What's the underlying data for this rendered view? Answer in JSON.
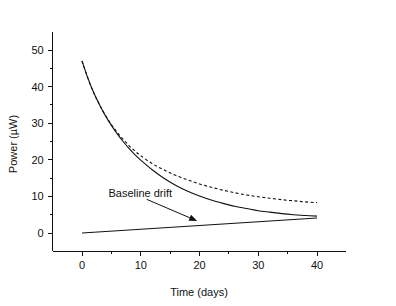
{
  "chart_data": {
    "type": "line",
    "title": "",
    "xlabel": "Time (days)",
    "ylabel": "Power (µW)",
    "xlim": [
      -5,
      45
    ],
    "ylim": [
      -5,
      55
    ],
    "xticks": [
      0,
      10,
      20,
      30,
      40
    ],
    "xtick_labels": [
      "0",
      "10",
      "20",
      "30",
      "40"
    ],
    "yticks": [
      0,
      10,
      20,
      30,
      40,
      50
    ],
    "ytick_labels": [
      "0",
      "10",
      "20",
      "30",
      "40",
      "50"
    ],
    "x_minor_ticks": [
      5,
      15,
      25,
      35
    ],
    "y_minor_ticks": [
      5,
      15,
      25,
      35,
      45
    ],
    "grid": false,
    "legend": "none",
    "series": [
      {
        "name": "Measured power (solid)",
        "style": "solid",
        "color": "#111111",
        "x": [
          0,
          1,
          2,
          3,
          4,
          5,
          6,
          7,
          8,
          9,
          10,
          12,
          14,
          16,
          18,
          20,
          22,
          24,
          26,
          28,
          30,
          32,
          34,
          36,
          38,
          40
        ],
        "y": [
          47.0,
          42.3,
          38.3,
          35.0,
          32.0,
          29.4,
          27.1,
          25.0,
          23.1,
          21.4,
          19.9,
          17.2,
          14.9,
          13.0,
          11.4,
          10.1,
          9.0,
          8.1,
          7.3,
          6.7,
          6.1,
          5.7,
          5.3,
          5.0,
          4.8,
          4.6
        ]
      },
      {
        "name": "Fitted decay (dashed)",
        "style": "dashed",
        "color": "#111111",
        "x": [
          0,
          1,
          2,
          3,
          4,
          5,
          6,
          7,
          8,
          9,
          10,
          12,
          14,
          16,
          18,
          20,
          22,
          24,
          26,
          28,
          30,
          32,
          34,
          36,
          38,
          40
        ],
        "y": [
          47.0,
          42.3,
          38.3,
          35.0,
          32.1,
          29.6,
          27.5,
          25.6,
          23.9,
          22.4,
          21.1,
          18.9,
          17.2,
          15.7,
          14.5,
          13.4,
          12.5,
          11.7,
          11.0,
          10.4,
          9.9,
          9.5,
          9.1,
          8.8,
          8.5,
          8.3
        ]
      },
      {
        "name": "Baseline drift",
        "style": "solid",
        "color": "#111111",
        "x": [
          0,
          40
        ],
        "y": [
          0.0,
          4.1
        ]
      }
    ],
    "annotations": [
      {
        "name": "baseline-drift",
        "text": "Baseline drift",
        "text_x": 4.5,
        "text_y": 11.0,
        "arrow_from_x": 11.0,
        "arrow_from_y": 9.2,
        "arrow_to_x": 19.6,
        "arrow_to_y": 3.3
      }
    ]
  }
}
